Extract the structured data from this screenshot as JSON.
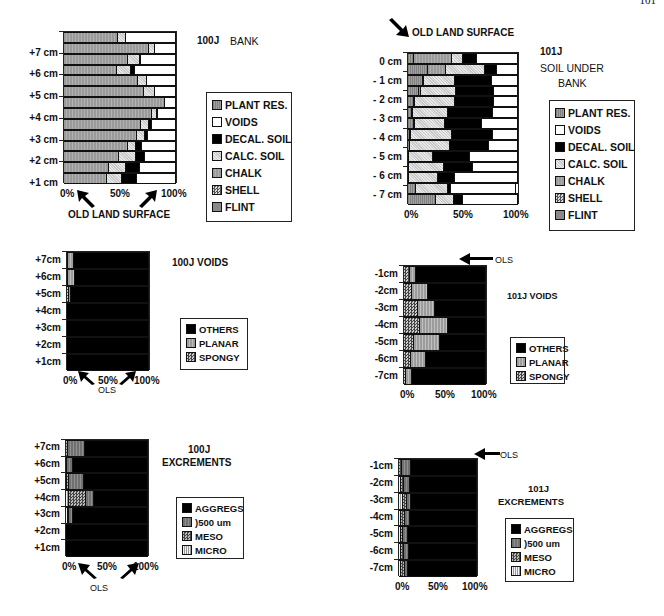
{
  "page": {
    "number": "101"
  },
  "chart_data": [
    {
      "id": "100j_bank",
      "type": "bar",
      "orientation": "horizontal-stacked-100",
      "title": "100J BANK",
      "xlabel": "",
      "ylabel": "",
      "x_ticks": [
        "0%",
        "50%",
        "100%"
      ],
      "y_ticks": [
        "+7 cm",
        "+6 cm",
        "+5 cm",
        "+4 cm",
        "+3 cm",
        "+2 cm",
        "+1 cm"
      ],
      "annotation": "OLD LAND SURFACE",
      "legend": [
        "PLANT RES.",
        "VOIDS",
        "DECAL. SOIL",
        "CALC. SOIL",
        "CHALK",
        "SHELL",
        "FLINT"
      ],
      "rows_top_to_bottom": 14,
      "series": [
        {
          "name": "CHALK",
          "values": [
            48,
            76,
            57,
            47,
            66,
            71,
            90,
            79,
            69,
            65,
            57,
            49,
            40,
            38
          ]
        },
        {
          "name": "CALC. SOIL",
          "values": [
            7,
            5,
            11,
            13,
            8,
            10,
            0,
            4,
            7,
            7,
            7,
            15,
            15,
            14
          ]
        },
        {
          "name": "DECAL. SOIL",
          "values": [
            0,
            0,
            1,
            3,
            0,
            0,
            0,
            1,
            3,
            3,
            6,
            8,
            13,
            13
          ]
        },
        {
          "name": "VOIDS",
          "values": [
            45,
            19,
            31,
            37,
            26,
            19,
            10,
            16,
            21,
            25,
            30,
            28,
            32,
            35
          ]
        }
      ]
    },
    {
      "id": "101j_soil_under_bank",
      "type": "bar",
      "orientation": "horizontal-stacked-100",
      "title": "101J SOIL UNDER BANK",
      "title_lines": [
        "101J",
        "SOIL UNDER",
        "BANK"
      ],
      "x_ticks": [
        "0%",
        "50%",
        "100%"
      ],
      "y_ticks": [
        "0 cm",
        "- 1 cm",
        "- 2 cm",
        "- 3 cm",
        "- 4 cm",
        "- 5 cm",
        "- 6 cm",
        "- 7 cm"
      ],
      "annotation": "OLD LAND SURFACE",
      "legend": [
        "PLANT RES.",
        "VOIDS",
        "DECAL. SOIL",
        "CALC. SOIL",
        "CHALK",
        "SHELL",
        "FLINT"
      ],
      "rows_top_to_bottom": 14,
      "series": [
        {
          "name": "PLANT RES.",
          "values": [
            5,
            18,
            14,
            10,
            5,
            4,
            5,
            2,
            2,
            1,
            1,
            1,
            7,
            25
          ]
        },
        {
          "name": "CHALK",
          "values": [
            35,
            17,
            1,
            2,
            1,
            1,
            1,
            1,
            0,
            0,
            0,
            0,
            0,
            0
          ]
        },
        {
          "name": "CALC. SOIL",
          "values": [
            10,
            35,
            28,
            32,
            37,
            31,
            28,
            37,
            36,
            22,
            32,
            26,
            29,
            17
          ]
        },
        {
          "name": "DECAL. SOIL",
          "values": [
            13,
            11,
            33,
            34,
            35,
            41,
            33,
            37,
            36,
            33,
            26,
            16,
            3,
            8
          ]
        },
        {
          "name": "VOIDS",
          "values": [
            37,
            19,
            24,
            22,
            22,
            23,
            33,
            23,
            26,
            44,
            41,
            57,
            59,
            50
          ]
        }
      ]
    },
    {
      "id": "100j_voids",
      "type": "bar",
      "orientation": "horizontal-stacked-100",
      "title": "100J VOIDS",
      "x_ticks": [
        "0%",
        "50%",
        "100%"
      ],
      "y_ticks": [
        "+7cm",
        "+6cm",
        "+5cm",
        "+4cm",
        "+3cm",
        "+2cm",
        "+1cm"
      ],
      "annotation": "OLS",
      "legend": [
        "OTHERS",
        "PLANAR",
        "SPONGY"
      ],
      "series": [
        {
          "name": "SPONGY",
          "values": [
            1,
            1,
            3,
            0,
            0,
            0,
            0
          ]
        },
        {
          "name": "PLANAR",
          "values": [
            7,
            9,
            2,
            0,
            0,
            0,
            0
          ]
        },
        {
          "name": "OTHERS",
          "values": [
            92,
            90,
            95,
            100,
            100,
            100,
            100
          ]
        }
      ]
    },
    {
      "id": "101j_voids",
      "type": "bar",
      "orientation": "horizontal-stacked-100",
      "title": "101J VOIDS",
      "x_ticks": [
        "0%",
        "50%",
        "100%"
      ],
      "y_ticks": [
        "-1cm",
        "-2cm",
        "-3cm",
        "-4cm",
        "-5cm",
        "-6cm",
        "-7cm"
      ],
      "annotation": "OLS",
      "legend": [
        "OTHERS",
        "PLANAR",
        "SPONGY"
      ],
      "series": [
        {
          "name": "SPONGY",
          "values": [
            7,
            10,
            17,
            19,
            12,
            8,
            3
          ]
        },
        {
          "name": "PLANAR",
          "values": [
            8,
            19,
            21,
            35,
            32,
            19,
            7
          ]
        },
        {
          "name": "OTHERS",
          "values": [
            85,
            71,
            62,
            46,
            56,
            73,
            90
          ]
        }
      ]
    },
    {
      "id": "100j_excrements",
      "type": "bar",
      "orientation": "horizontal-stacked-100",
      "title": "100J EXCREMENTS",
      "title_lines": [
        "100J",
        "EXCREMENTS"
      ],
      "x_ticks": [
        "0%",
        "50%",
        "100%"
      ],
      "y_ticks": [
        "+7cm",
        "+6cm",
        "+5cm",
        "+4cm",
        "+3cm",
        "+2cm",
        "+1cm"
      ],
      "annotation": "OLS",
      "legend": [
        "AGGREGS",
        ")500 um",
        "MESO",
        "MICRO"
      ],
      "series": [
        {
          "name": "MICRO",
          "values": [
            0,
            0,
            1,
            4,
            3,
            0,
            0
          ]
        },
        {
          "name": "MESO",
          "values": [
            2,
            1,
            3,
            20,
            1,
            0,
            0
          ]
        },
        {
          "name": ")500 um",
          "values": [
            21,
            7,
            18,
            10,
            4,
            0,
            0
          ]
        },
        {
          "name": "AGGREGS",
          "values": [
            77,
            92,
            78,
            66,
            92,
            100,
            100
          ]
        }
      ]
    },
    {
      "id": "101j_excrements",
      "type": "bar",
      "orientation": "horizontal-stacked-100",
      "title": "101J EXCREMENTS",
      "title_lines": [
        "101J",
        "EXCREMENTS"
      ],
      "x_ticks": [
        "0%",
        "50%",
        "100%"
      ],
      "y_ticks": [
        "-1cm",
        "-2cm",
        "-3cm",
        "-4cm",
        "-5cm",
        "-6cm",
        "-7cm"
      ],
      "annotation": "OLS",
      "legend": [
        "AGGREGS",
        ")500 um",
        "MESO",
        "MICRO"
      ],
      "series": [
        {
          "name": "MICRO",
          "values": [
            0,
            3,
            5,
            3,
            2,
            3,
            3
          ]
        },
        {
          "name": "MESO",
          "values": [
            4,
            4,
            5,
            5,
            3,
            4,
            5
          ]
        },
        {
          "name": ")500 um",
          "values": [
            11,
            7,
            6,
            6,
            7,
            6,
            4
          ]
        },
        {
          "name": "AGGREGS",
          "values": [
            85,
            86,
            84,
            86,
            88,
            87,
            88
          ]
        }
      ]
    }
  ],
  "labels": {
    "bank_title_a": "100J",
    "bank_title_b": "BANK",
    "old_land_surface": "OLD LAND SURFACE",
    "ols": "OLS",
    "soil_title": [
      "101J",
      "SOIL UNDER",
      "BANK"
    ],
    "voids100_title": "100J VOIDS",
    "voids101_title": "101J VOIDS",
    "exc100_title": [
      "100J",
      "EXCREMENTS"
    ],
    "exc101_title": [
      "101J",
      "EXCREMENTS"
    ],
    "x0": "0%",
    "x50": "50%",
    "x100": "100%"
  }
}
